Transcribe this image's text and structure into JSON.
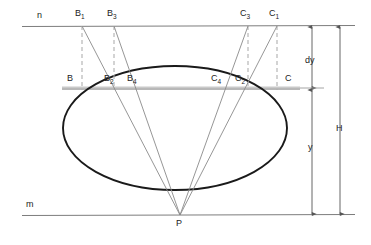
{
  "figure": {
    "type": "technical-geometry-diagram",
    "background_color": "#ffffff",
    "outline_color": "#1a1a1a",
    "ray_color": "#8a8a8a",
    "dashed_color": "#a8a8a8",
    "chord_color": "#9a9a9a",
    "dimension_color": "#555555"
  },
  "lines": {
    "top_line_label": "n",
    "bottom_line_label": "m",
    "top_line_y": 26,
    "bottom_line_y": 215
  },
  "apex": {
    "label": "P",
    "x": 180,
    "y": 215
  },
  "ellipse": {
    "center_x": 175,
    "center_y": 128,
    "radius_x": 112,
    "radius_y": 62
  },
  "points_on_line_n": [
    {
      "label": "B",
      "sub": "1",
      "x": 82
    },
    {
      "label": "B",
      "sub": "3",
      "x": 114
    },
    {
      "label": "C",
      "sub": "3",
      "x": 248
    },
    {
      "label": "C",
      "sub": "1",
      "x": 277
    }
  ],
  "points_on_chord": [
    {
      "label": "B",
      "sub": "",
      "x": 63
    },
    {
      "label": "B",
      "sub": "2",
      "x": 104
    },
    {
      "label": "B",
      "sub": "4",
      "x": 125
    },
    {
      "label": "C",
      "sub": "4",
      "x": 218
    },
    {
      "label": "C",
      "sub": "2",
      "x": 240
    },
    {
      "label": "C",
      "sub": "",
      "x": 287
    }
  ],
  "chord": {
    "y": 89,
    "x_start": 62,
    "x_end": 300
  },
  "dimensions": [
    {
      "name": "dy",
      "label": "dy",
      "x": 312,
      "y_top": 26,
      "y_bottom": 89
    },
    {
      "name": "y",
      "label": "y",
      "x": 312,
      "y_top": 89,
      "y_bottom": 215
    },
    {
      "name": "H",
      "label": "H",
      "x": 340,
      "y_top": 26,
      "y_bottom": 215
    }
  ],
  "labels": {
    "line_n": "n",
    "line_m": "m",
    "apex": "P",
    "B1": "B",
    "B1_sub": "1",
    "B3": "B",
    "B3_sub": "3",
    "C3": "C",
    "C3_sub": "3",
    "C1": "C",
    "C1_sub": "1",
    "B": "B",
    "B_sub": "",
    "B2": "B",
    "B2_sub": "2",
    "B4": "B",
    "B4_sub": "4",
    "C4": "C",
    "C4_sub": "4",
    "C2": "C",
    "C2_sub": "2",
    "C": "C",
    "C_sub": "",
    "dy": "dy",
    "y": "y",
    "H": "H"
  }
}
